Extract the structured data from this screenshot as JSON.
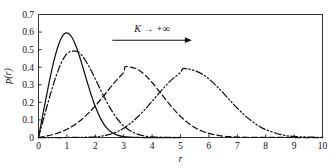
{
  "chart_data": {
    "type": "line",
    "title": "",
    "xlabel": "r",
    "ylabel": "p(r)",
    "xlim": [
      0,
      10
    ],
    "ylim": [
      0,
      0.7
    ],
    "grid": false,
    "legend": "none",
    "xticks": [
      "0",
      "1",
      "2",
      "3",
      "4",
      "5",
      "6",
      "7",
      "8",
      "9",
      "10"
    ],
    "yticks": [
      "0",
      "0.1",
      "0.2",
      "0.3",
      "0.4",
      "0.5",
      "0.6",
      "0.7"
    ],
    "annotations": [
      {
        "name": "k-to-infinity-annotation",
        "text": "K → +∞",
        "arrow": "right",
        "x_data_start": 2.6,
        "x_data_end": 5.4,
        "y_data": 0.585
      }
    ],
    "series": [
      {
        "name": "curve-1",
        "style": "solid",
        "peak_x": 1.02,
        "peak_y": 0.595,
        "x": [
          0,
          0.1,
          0.2,
          0.3,
          0.4,
          0.5,
          0.6,
          0.7,
          0.8,
          0.9,
          1.0,
          1.1,
          1.2,
          1.3,
          1.4,
          1.5,
          1.6,
          1.7,
          1.8,
          1.9,
          2.0,
          2.2,
          2.4,
          2.6,
          2.8,
          3.0,
          3.2,
          3.4,
          3.6,
          3.8,
          4.0,
          4.5,
          5.0
        ],
        "y": [
          0.0,
          0.085,
          0.17,
          0.253,
          0.333,
          0.408,
          0.472,
          0.525,
          0.565,
          0.589,
          0.595,
          0.586,
          0.563,
          0.528,
          0.484,
          0.433,
          0.379,
          0.324,
          0.271,
          0.221,
          0.176,
          0.103,
          0.055,
          0.027,
          0.012,
          0.005,
          0.002,
          0.001,
          0.0,
          0.0,
          0.0,
          0.0,
          0.0
        ]
      },
      {
        "name": "curve-2",
        "style": "dashdot",
        "peak_x": 1.3,
        "peak_y": 0.492,
        "x": [
          0,
          0.1,
          0.2,
          0.3,
          0.4,
          0.5,
          0.6,
          0.7,
          0.8,
          0.9,
          1.0,
          1.1,
          1.2,
          1.3,
          1.4,
          1.5,
          1.6,
          1.8,
          2.0,
          2.2,
          2.4,
          2.6,
          2.8,
          3.0,
          3.2,
          3.4,
          3.6,
          3.8,
          4.0,
          4.2,
          4.5,
          5.0
        ],
        "y": [
          0.0,
          0.06,
          0.12,
          0.178,
          0.235,
          0.29,
          0.34,
          0.385,
          0.424,
          0.455,
          0.476,
          0.488,
          0.492,
          0.492,
          0.486,
          0.472,
          0.452,
          0.398,
          0.333,
          0.266,
          0.203,
          0.147,
          0.101,
          0.066,
          0.041,
          0.024,
          0.013,
          0.007,
          0.003,
          0.002,
          0.001,
          0.0
        ]
      },
      {
        "name": "curve-3",
        "style": "dashed",
        "peak_x": 3.05,
        "peak_y": 0.402,
        "x": [
          0,
          0.25,
          0.5,
          0.75,
          1.0,
          1.25,
          1.5,
          1.75,
          2.0,
          2.25,
          2.5,
          2.75,
          3.0,
          3.05,
          3.25,
          3.5,
          3.75,
          4.0,
          4.25,
          4.5,
          4.75,
          5.0,
          5.25,
          5.5,
          5.75,
          6.0,
          6.25,
          6.5,
          6.75,
          7.0,
          7.5,
          8.0,
          9.0,
          10.0
        ],
        "y": [
          0.0,
          0.007,
          0.016,
          0.029,
          0.047,
          0.07,
          0.1,
          0.137,
          0.18,
          0.228,
          0.278,
          0.327,
          0.37,
          0.402,
          0.4,
          0.387,
          0.356,
          0.313,
          0.263,
          0.212,
          0.163,
          0.12,
          0.085,
          0.057,
          0.037,
          0.023,
          0.014,
          0.008,
          0.0045,
          0.0025,
          0.0008,
          0.0002,
          0.0,
          0.0
        ]
      },
      {
        "name": "curve-4",
        "style": "dashdotdot",
        "peak_x": 5.08,
        "peak_y": 0.392,
        "x": [
          0,
          0.5,
          1.0,
          1.5,
          2.0,
          2.25,
          2.5,
          2.75,
          3.0,
          3.25,
          3.5,
          3.75,
          4.0,
          4.25,
          4.5,
          4.75,
          5.0,
          5.08,
          5.25,
          5.5,
          5.75,
          6.0,
          6.25,
          6.5,
          6.75,
          7.0,
          7.25,
          7.5,
          7.75,
          8.0,
          8.5,
          9.0,
          10.0
        ],
        "y": [
          0.0,
          0.0,
          0.0,
          0.001,
          0.004,
          0.009,
          0.018,
          0.032,
          0.053,
          0.082,
          0.118,
          0.16,
          0.206,
          0.253,
          0.298,
          0.338,
          0.37,
          0.392,
          0.39,
          0.381,
          0.362,
          0.333,
          0.296,
          0.254,
          0.21,
          0.167,
          0.128,
          0.094,
          0.066,
          0.045,
          0.018,
          0.006,
          0.0005
        ]
      }
    ]
  },
  "figure": {
    "background_color": "#ffffff",
    "line_color": "#111111",
    "frame_color": "#333333"
  }
}
